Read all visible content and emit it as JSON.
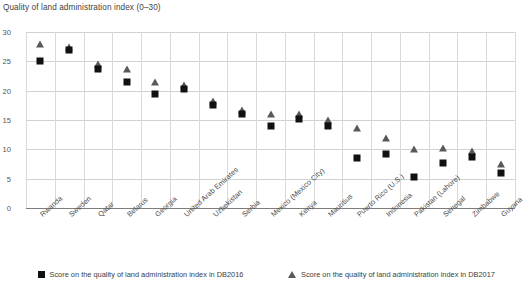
{
  "chart_data": {
    "type": "scatter",
    "title": "Quality of land administration index (0–30)",
    "xlabel": "",
    "ylabel": "",
    "ylim": [
      0,
      30
    ],
    "yticks": [
      0,
      5,
      10,
      15,
      20,
      25,
      30
    ],
    "grid": true,
    "legend_position": "bottom",
    "categories": [
      "Rwanda",
      "Sweden",
      "Qatar",
      "Belarus",
      "Georgia",
      "United Arab Emirates",
      "Uzbekistan",
      "Serbia",
      "Mexico (Mexico City)",
      "Kenya",
      "Mauritius",
      "Puerto Rico (U.S.)",
      "Indonesia",
      "Pakistan (Lahore)",
      "Senegal",
      "Zimbabwe",
      "Guyana"
    ],
    "series": [
      {
        "name": "Score on the quality of land administration index in DB2016",
        "marker": "square",
        "color": "#111111",
        "values": [
          25,
          27,
          23.7,
          21.5,
          19.5,
          20.3,
          17.5,
          16,
          14,
          15.1,
          14,
          8.6,
          9.2,
          5.2,
          7.6,
          8.7,
          6
        ]
      },
      {
        "name": "Score on the quality of land administration index in DB2017",
        "marker": "triangle",
        "color": "#595959",
        "values": [
          28,
          27.5,
          24.5,
          23.7,
          21.5,
          21,
          18.3,
          16.7,
          16,
          16,
          15,
          13.7,
          12,
          10,
          10.2,
          9.7,
          7.5
        ]
      }
    ]
  },
  "legend": {
    "items": [
      {
        "label": "Score on the quality of land administration index in DB2016",
        "icon": "square-marker"
      },
      {
        "label": "Score on the quality of land administration index in DB2017",
        "icon": "triangle-marker"
      }
    ]
  }
}
